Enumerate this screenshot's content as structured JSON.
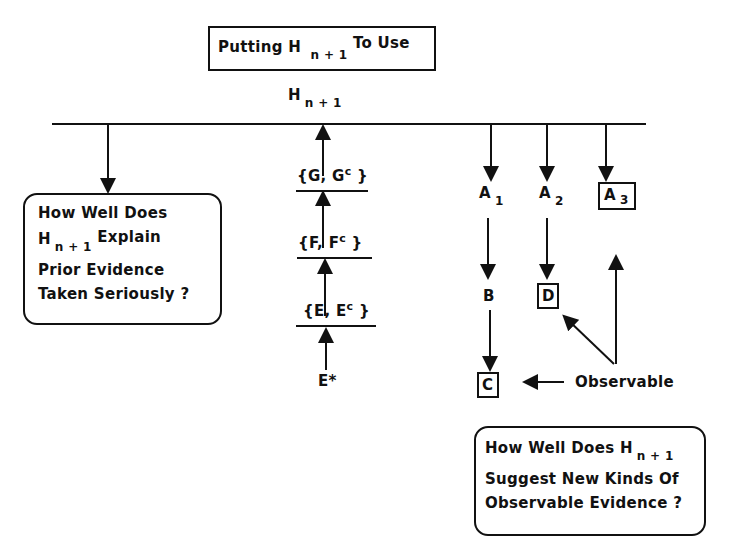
{
  "title": {
    "prefix": "Putting H",
    "sub": "n + 1",
    "suffix": "To Use"
  },
  "top_node": {
    "main": "H",
    "sub": "n + 1"
  },
  "left_box": {
    "line1": "How Well Does",
    "line2_main": "H",
    "line2_sub": "n + 1",
    "line2_rest": "Explain",
    "line3": "Prior Evidence",
    "line4": "Taken Seriously ?"
  },
  "chain": [
    {
      "label": "{G, G",
      "sup": "c",
      "close": "}"
    },
    {
      "label": "{F, F",
      "sup": "c",
      "close": "}"
    },
    {
      "label": "{E, E",
      "sup": "c",
      "close": "}"
    }
  ],
  "evidence_star": "E*",
  "branches": {
    "a1": {
      "main": "A",
      "sub": "1"
    },
    "a2": {
      "main": "A",
      "sub": "2"
    },
    "a3": {
      "main": "A",
      "sub": "3"
    },
    "b": "B",
    "c": "C",
    "d": "D"
  },
  "observable_label": "Observable",
  "right_box": {
    "line1_main": "How Well Does H",
    "line1_sub": "n + 1",
    "line2": "Suggest New Kinds Of",
    "line3": "Observable Evidence ?"
  },
  "colors": {
    "ink": "#111111",
    "background": "#ffffff"
  }
}
